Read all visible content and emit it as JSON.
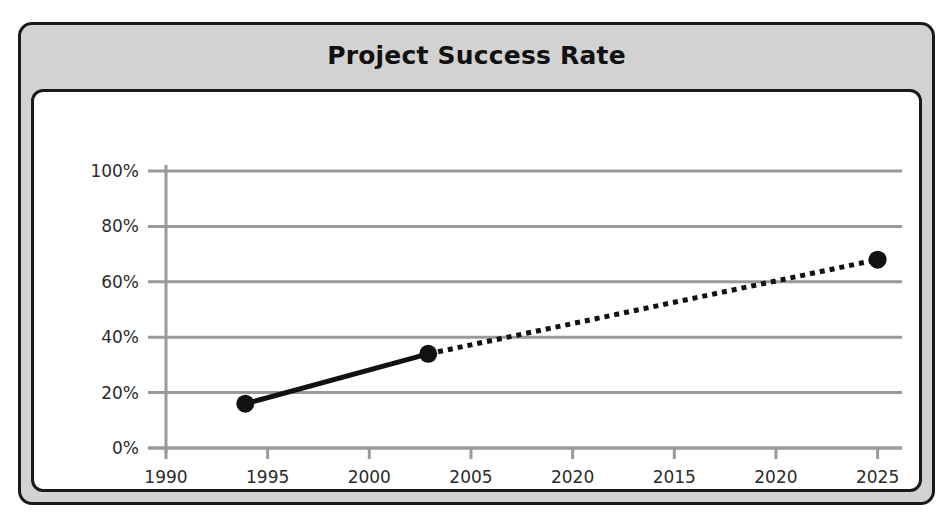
{
  "chart_data": {
    "type": "line",
    "title": "Project Success Rate",
    "xlabel": "",
    "ylabel": "",
    "xlim": [
      1990,
      2026.2
    ],
    "ylim": [
      0,
      100
    ],
    "grid": true,
    "legend": null,
    "x_tick_labels": [
      "1990",
      "1995",
      "2000",
      "2005",
      "2020",
      "2015",
      "2020",
      "2025"
    ],
    "x_tick_values": [
      1990,
      1995,
      2000,
      2005,
      2010,
      2015,
      2020,
      2025
    ],
    "y_tick_labels": [
      "0%",
      "20%",
      "40%",
      "60%",
      "80%",
      "100%"
    ],
    "y_tick_values": [
      0,
      20,
      40,
      60,
      80,
      100
    ],
    "series": [
      {
        "name": "Success Rate",
        "style": "solid",
        "color": "#111111",
        "x": [
          1993.9,
          2002.9
        ],
        "values": [
          16,
          34
        ],
        "markers": true
      },
      {
        "name": "Success Rate (projected)",
        "style": "dotted",
        "color": "#111111",
        "x": [
          2002.9,
          2025.0
        ],
        "values": [
          34,
          68
        ],
        "markers": true
      }
    ],
    "points": [
      {
        "x": 1993.9,
        "y": 16,
        "label": ""
      },
      {
        "x": 2002.9,
        "y": 34,
        "label": ""
      },
      {
        "x": 2025.0,
        "y": 68,
        "label": ""
      }
    ]
  },
  "colors": {
    "panel_background": "#d2d2d2",
    "plot_background": "#ffffff",
    "border": "#1a1a1a",
    "grid": "#9a9a9a",
    "series": "#111111",
    "text": "#111111"
  }
}
